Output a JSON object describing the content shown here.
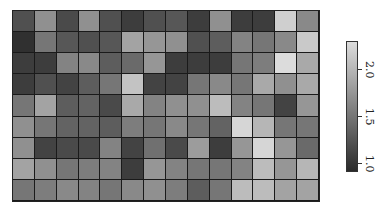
{
  "chart_data": {
    "type": "heatmap",
    "title": "",
    "xlabel": "",
    "ylabel": "",
    "rows": 9,
    "cols": 14,
    "values": [
      [
        1.2,
        1.7,
        1.15,
        1.7,
        1.2,
        1.05,
        1.2,
        1.25,
        1.05,
        1.7,
        1.05,
        1.05,
        2.2,
        1.65
      ],
      [
        0.95,
        1.5,
        1.25,
        1.2,
        1.25,
        1.85,
        1.75,
        1.7,
        1.2,
        1.3,
        1.6,
        1.5,
        1.65,
        2.15
      ],
      [
        1.05,
        1.05,
        1.6,
        1.65,
        1.3,
        1.4,
        1.75,
        1.05,
        1.05,
        1.05,
        1.5,
        1.55,
        2.3,
        1.9
      ],
      [
        1.05,
        1.2,
        1.1,
        1.3,
        1.5,
        2.1,
        1.1,
        1.1,
        1.5,
        1.65,
        1.5,
        1.9,
        1.7,
        1.9
      ],
      [
        1.5,
        1.85,
        1.3,
        1.35,
        1.15,
        1.9,
        1.6,
        1.7,
        1.7,
        2.05,
        1.6,
        1.5,
        1.1,
        1.75
      ],
      [
        1.7,
        1.5,
        1.35,
        1.35,
        1.3,
        1.55,
        1.5,
        1.65,
        1.5,
        1.35,
        2.25,
        2.0,
        1.5,
        1.5
      ],
      [
        1.7,
        1.1,
        1.15,
        1.15,
        1.6,
        1.1,
        1.45,
        1.15,
        1.8,
        1.05,
        1.75,
        2.25,
        1.75,
        1.4
      ],
      [
        1.85,
        1.7,
        1.5,
        1.55,
        1.6,
        1.05,
        1.75,
        1.6,
        1.5,
        1.5,
        1.6,
        2.05,
        1.75,
        2.0
      ],
      [
        1.5,
        1.55,
        1.65,
        1.6,
        1.5,
        1.65,
        1.7,
        1.55,
        1.3,
        1.5,
        2.05,
        2.05,
        1.85,
        1.85
      ]
    ],
    "colorbar": {
      "min": 0.9,
      "max": 2.3,
      "ticks": [
        1.0,
        1.5,
        2.0
      ],
      "tick_labels": [
        "1.0",
        "1.5",
        "2.0"
      ],
      "colormap": "grayscale",
      "low_color": "#2a2a2a",
      "high_color": "#dcdcdc",
      "orientation": "vertical",
      "label_rotation": 90
    },
    "grid": true,
    "legend_position": "right"
  }
}
